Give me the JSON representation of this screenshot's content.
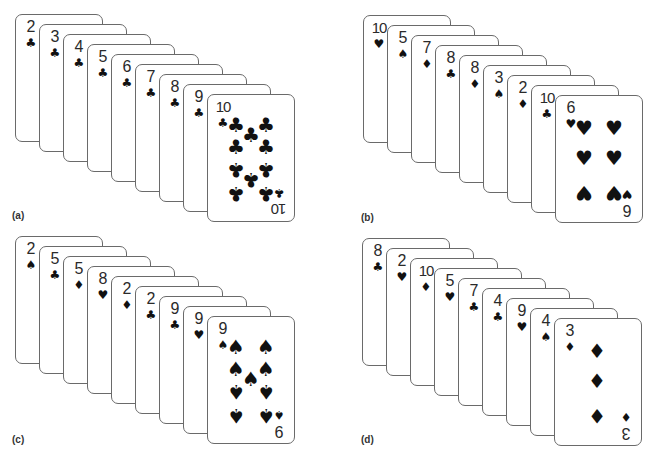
{
  "panels": [
    {
      "label": "(a)",
      "origin": [
        15,
        14
      ],
      "label_pos": [
        12,
        210
      ],
      "cards": [
        {
          "rank": "2",
          "suit": "♣"
        },
        {
          "rank": "3",
          "suit": "♣"
        },
        {
          "rank": "4",
          "suit": "♣"
        },
        {
          "rank": "5",
          "suit": "♣"
        },
        {
          "rank": "6",
          "suit": "♣"
        },
        {
          "rank": "7",
          "suit": "♣"
        },
        {
          "rank": "8",
          "suit": "♣"
        },
        {
          "rank": "9",
          "suit": "♣"
        },
        {
          "rank": "10",
          "suit": "♣"
        }
      ]
    },
    {
      "label": "(b)",
      "origin": [
        363,
        15
      ],
      "label_pos": [
        361,
        212
      ],
      "cards": [
        {
          "rank": "10",
          "suit": "♥"
        },
        {
          "rank": "5",
          "suit": "♠"
        },
        {
          "rank": "7",
          "suit": "♦"
        },
        {
          "rank": "8",
          "suit": "♣"
        },
        {
          "rank": "8",
          "suit": "♦"
        },
        {
          "rank": "3",
          "suit": "♠"
        },
        {
          "rank": "2",
          "suit": "♦"
        },
        {
          "rank": "10",
          "suit": "♣"
        },
        {
          "rank": "6",
          "suit": "♥"
        }
      ]
    },
    {
      "label": "(c)",
      "origin": [
        15,
        236
      ],
      "label_pos": [
        12,
        434
      ],
      "cards": [
        {
          "rank": "2",
          "suit": "♠"
        },
        {
          "rank": "5",
          "suit": "♣"
        },
        {
          "rank": "5",
          "suit": "♦"
        },
        {
          "rank": "8",
          "suit": "♥"
        },
        {
          "rank": "2",
          "suit": "♦"
        },
        {
          "rank": "2",
          "suit": "♣"
        },
        {
          "rank": "9",
          "suit": "♣"
        },
        {
          "rank": "9",
          "suit": "♥"
        },
        {
          "rank": "9",
          "suit": "♠"
        }
      ]
    },
    {
      "label": "(d)",
      "origin": [
        362,
        238
      ],
      "label_pos": [
        361,
        434
      ],
      "cards": [
        {
          "rank": "8",
          "suit": "♣"
        },
        {
          "rank": "2",
          "suit": "♥"
        },
        {
          "rank": "10",
          "suit": "♦"
        },
        {
          "rank": "5",
          "suit": "♥"
        },
        {
          "rank": "7",
          "suit": "♣"
        },
        {
          "rank": "4",
          "suit": "♣"
        },
        {
          "rank": "9",
          "suit": "♥"
        },
        {
          "rank": "4",
          "suit": "♠"
        },
        {
          "rank": "3",
          "suit": "♦"
        }
      ]
    }
  ],
  "card_step": [
    24,
    10
  ],
  "pip_layouts": {
    "3": [
      [
        42,
        32,
        0
      ],
      [
        42,
        62,
        0
      ],
      [
        42,
        97,
        1
      ]
    ],
    "6": [
      [
        28,
        32,
        0
      ],
      [
        58,
        32,
        0
      ],
      [
        28,
        62,
        0
      ],
      [
        58,
        62,
        0
      ],
      [
        28,
        97,
        1
      ],
      [
        58,
        97,
        1
      ]
    ],
    "9": [
      [
        28,
        30,
        0
      ],
      [
        58,
        30,
        0
      ],
      [
        28,
        52,
        0
      ],
      [
        58,
        52,
        0
      ],
      [
        43,
        62,
        0
      ],
      [
        28,
        75,
        1
      ],
      [
        58,
        75,
        1
      ],
      [
        28,
        99,
        1
      ],
      [
        58,
        99,
        1
      ]
    ],
    "10": [
      [
        28,
        30,
        0
      ],
      [
        58,
        30,
        0
      ],
      [
        43,
        40,
        0
      ],
      [
        28,
        52,
        0
      ],
      [
        58,
        52,
        0
      ],
      [
        28,
        75,
        1
      ],
      [
        58,
        75,
        1
      ],
      [
        43,
        85,
        1
      ],
      [
        28,
        99,
        1
      ],
      [
        58,
        99,
        1
      ]
    ]
  }
}
